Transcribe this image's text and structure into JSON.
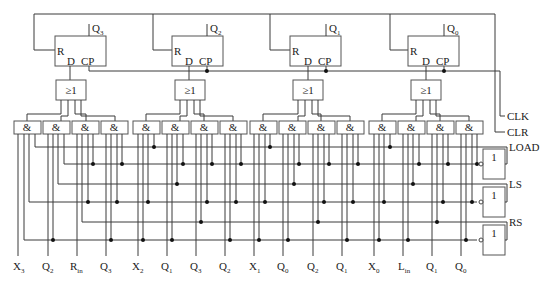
{
  "diagram": {
    "type": "4-bit bidirectional shift register with parallel load",
    "flipflops": [
      {
        "id": "FF3",
        "output": "Q",
        "output_sub": "3",
        "pins": {
          "reset": "R",
          "data": "D",
          "clock": "CP"
        }
      },
      {
        "id": "FF2",
        "output": "Q",
        "output_sub": "2",
        "pins": {
          "reset": "R",
          "data": "D",
          "clock": "CP"
        }
      },
      {
        "id": "FF1",
        "output": "Q",
        "output_sub": "1",
        "pins": {
          "reset": "R",
          "data": "D",
          "clock": "CP"
        }
      },
      {
        "id": "FF0",
        "output": "Q",
        "output_sub": "0",
        "pins": {
          "reset": "R",
          "data": "D",
          "clock": "CP"
        }
      }
    ],
    "or_gate_label": "≥1",
    "and_gate_label": "&",
    "not_gate_label": "1",
    "control_signals": {
      "clk": "CLK",
      "clr": "CLR",
      "load": "LOAD",
      "ls": "LS",
      "rs": "RS"
    },
    "bottom_inputs": [
      {
        "main": "X",
        "sub": "3"
      },
      {
        "main": "Q",
        "sub": "2"
      },
      {
        "main": "R",
        "sub": "in"
      },
      {
        "main": "Q",
        "sub": "3"
      },
      {
        "main": "X",
        "sub": "2"
      },
      {
        "main": "Q",
        "sub": "1"
      },
      {
        "main": "Q",
        "sub": "3"
      },
      {
        "main": "Q",
        "sub": "2"
      },
      {
        "main": "X",
        "sub": "1"
      },
      {
        "main": "Q",
        "sub": "0"
      },
      {
        "main": "Q",
        "sub": "2"
      },
      {
        "main": "Q",
        "sub": "1"
      },
      {
        "main": "X",
        "sub": "0"
      },
      {
        "main": "L",
        "sub": "in"
      },
      {
        "main": "Q",
        "sub": "1"
      },
      {
        "main": "Q",
        "sub": "0"
      }
    ]
  }
}
